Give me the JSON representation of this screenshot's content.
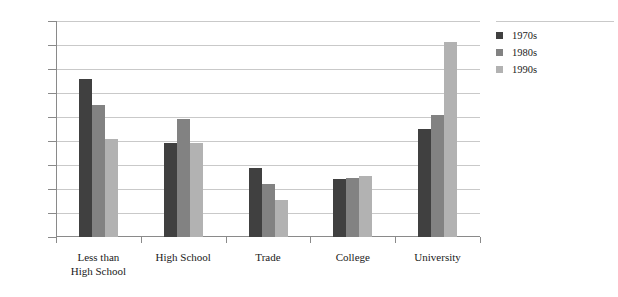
{
  "chart_data": {
    "type": "bar",
    "title": "",
    "subtitle": "",
    "xlabel": "",
    "ylabel": "",
    "categories": [
      "Less than High School",
      "High School",
      "Trade",
      "College",
      "University"
    ],
    "category_label_lines": [
      [
        "Less than",
        "High School"
      ],
      [
        "High School"
      ],
      [
        "Trade"
      ],
      [
        "College"
      ],
      [
        "University"
      ]
    ],
    "series": [
      {
        "name": "1970s",
        "color": "#404040",
        "values": [
          33.0,
          19.5,
          14.3,
          12.0,
          22.5
        ]
      },
      {
        "name": "1980s",
        "color": "#828282",
        "values": [
          27.5,
          24.5,
          11.0,
          12.3,
          25.5
        ]
      },
      {
        "name": "1990s",
        "color": "#b2b2b2",
        "values": [
          20.5,
          19.5,
          7.8,
          12.8,
          40.7
        ]
      }
    ],
    "ylim": [
      0,
      45
    ],
    "ytick_values": [
      0,
      5,
      10,
      15,
      20,
      25,
      30,
      35,
      40,
      45
    ],
    "ytick_labels": [
      "0%",
      "5%",
      "10%",
      "15%",
      "20%",
      "25%",
      "30%",
      "35%",
      "40%",
      "45%"
    ],
    "grid": true,
    "grid_axis": "y",
    "legend_position": "right",
    "legend_entries": [
      "1970s",
      "1980s",
      "1990s"
    ],
    "annotations": []
  },
  "colors": {
    "axis": "#8a8a8a",
    "grid": "#c9c9c9",
    "text": "#1a1a1a",
    "background": "#ffffff"
  }
}
